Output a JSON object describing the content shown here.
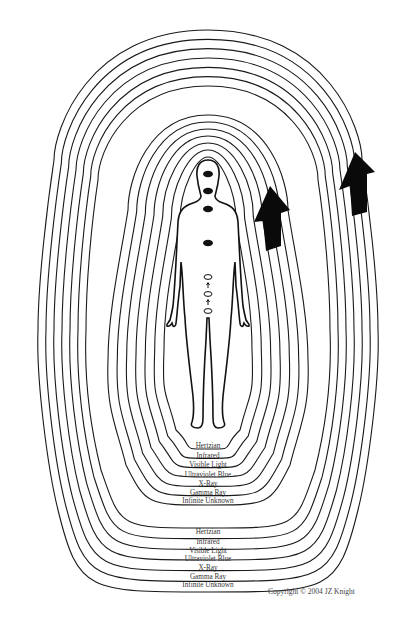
{
  "diagram": {
    "inner_band": {
      "labels": [
        "Hertzian",
        "Infrared",
        "Visible Light",
        "Ultraviolet Blue",
        "X-Ray",
        "Gamma Ray",
        "Infinite Unknown"
      ]
    },
    "outer_band": {
      "labels": [
        "Hertzian",
        "Infrared",
        "Visible Light",
        "Ultraviolet Blue",
        "X-Ray",
        "Gamma Ray",
        "Infinite Unknown"
      ]
    },
    "figure": {
      "description": "Human body outline with seven seals",
      "seals_filled": 4,
      "seals_open": 3
    },
    "arrows": [
      "up-arrow-inner-band",
      "up-arrow-outer-band"
    ],
    "copyright": "Copyright © 2004 JZ Knight",
    "colors": {
      "line": "#1a1a1a",
      "background": "#ffffff"
    }
  }
}
